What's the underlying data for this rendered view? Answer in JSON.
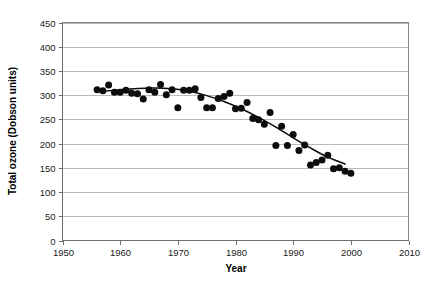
{
  "chart_data": {
    "type": "scatter",
    "title": "",
    "xlabel": "Year",
    "ylabel": "Total ozone (Dobson units)",
    "xlim": [
      1950,
      2010
    ],
    "ylim": [
      0,
      450
    ],
    "grid": "horizontal",
    "legend": "none",
    "xticks": [
      1950,
      1960,
      1970,
      1980,
      1990,
      2000,
      2010
    ],
    "yticks": [
      0,
      50,
      100,
      150,
      200,
      250,
      300,
      350,
      400,
      450
    ],
    "xtick_labels": [
      "1950",
      "1960",
      "1970",
      "1980",
      "1990",
      "2000",
      "2010"
    ],
    "ytick_labels": [
      "0",
      "50",
      "100",
      "150",
      "200",
      "250",
      "300",
      "350",
      "400",
      "450"
    ],
    "series": [
      {
        "name": "Total ozone observations",
        "marker": "filled-circle",
        "color": "#0c0c0c",
        "points": [
          [
            1956,
            311
          ],
          [
            1957,
            309
          ],
          [
            1958,
            321
          ],
          [
            1959,
            306
          ],
          [
            1960,
            306
          ],
          [
            1961,
            310
          ],
          [
            1962,
            304
          ],
          [
            1963,
            303
          ],
          [
            1964,
            292
          ],
          [
            1965,
            311
          ],
          [
            1966,
            306
          ],
          [
            1967,
            322
          ],
          [
            1968,
            301
          ],
          [
            1969,
            311
          ],
          [
            1970,
            274
          ],
          [
            1971,
            310
          ],
          [
            1972,
            310
          ],
          [
            1973,
            313
          ],
          [
            1974,
            295
          ],
          [
            1975,
            274
          ],
          [
            1976,
            274
          ],
          [
            1977,
            293
          ],
          [
            1978,
            297
          ],
          [
            1979,
            304
          ],
          [
            1980,
            272
          ],
          [
            1981,
            273
          ],
          [
            1982,
            285
          ],
          [
            1983,
            252
          ],
          [
            1984,
            249
          ],
          [
            1985,
            240
          ],
          [
            1986,
            264
          ],
          [
            1987,
            196
          ],
          [
            1988,
            236
          ],
          [
            1989,
            196
          ],
          [
            1990,
            219
          ],
          [
            1991,
            186
          ],
          [
            1992,
            197
          ],
          [
            1993,
            156
          ],
          [
            1994,
            161
          ],
          [
            1995,
            166
          ],
          [
            1996,
            176
          ],
          [
            1997,
            148
          ],
          [
            1998,
            150
          ],
          [
            1999,
            143
          ],
          [
            2000,
            139
          ]
        ]
      }
    ],
    "trend": {
      "name": "Fitted trend curve",
      "color": "#0c0c0c",
      "points": [
        [
          1957,
          308
        ],
        [
          1960,
          311
        ],
        [
          1963,
          314
        ],
        [
          1966,
          315
        ],
        [
          1969,
          313
        ],
        [
          1972,
          308
        ],
        [
          1975,
          299
        ],
        [
          1978,
          287
        ],
        [
          1981,
          272
        ],
        [
          1984,
          254
        ],
        [
          1987,
          234
        ],
        [
          1990,
          212
        ],
        [
          1993,
          191
        ],
        [
          1996,
          172
        ],
        [
          1999,
          158
        ]
      ]
    }
  }
}
